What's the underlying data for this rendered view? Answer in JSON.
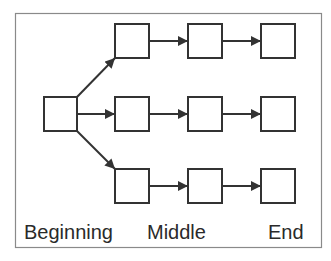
{
  "diagram": {
    "colors": {
      "stroke": "#333333",
      "frame": "#8a8a8a",
      "background": "#ffffff"
    },
    "labels": {
      "beginning": "Beginning",
      "middle": "Middle",
      "end": "End"
    },
    "nodes": [
      {
        "id": "start",
        "row": "middle",
        "column": 0
      },
      {
        "id": "top-1",
        "row": "top",
        "column": 1
      },
      {
        "id": "top-2",
        "row": "top",
        "column": 2
      },
      {
        "id": "top-3",
        "row": "top",
        "column": 3
      },
      {
        "id": "mid-1",
        "row": "middle",
        "column": 1
      },
      {
        "id": "mid-2",
        "row": "middle",
        "column": 2
      },
      {
        "id": "mid-3",
        "row": "middle",
        "column": 3
      },
      {
        "id": "bot-1",
        "row": "bottom",
        "column": 1
      },
      {
        "id": "bot-2",
        "row": "bottom",
        "column": 2
      },
      {
        "id": "bot-3",
        "row": "bottom",
        "column": 3
      }
    ],
    "edges": [
      [
        "start",
        "top-1"
      ],
      [
        "start",
        "mid-1"
      ],
      [
        "start",
        "bot-1"
      ],
      [
        "top-1",
        "top-2"
      ],
      [
        "top-2",
        "top-3"
      ],
      [
        "mid-1",
        "mid-2"
      ],
      [
        "mid-2",
        "mid-3"
      ],
      [
        "bot-1",
        "bot-2"
      ],
      [
        "bot-2",
        "bot-3"
      ]
    ]
  }
}
